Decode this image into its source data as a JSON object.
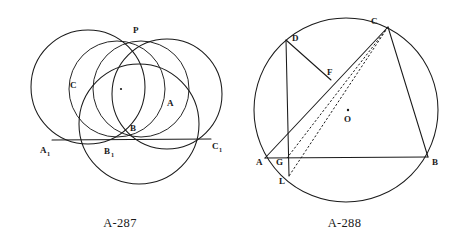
{
  "page": {
    "background": "#ffffff",
    "ink_color": "#1a1a1a",
    "width": 459,
    "height": 248
  },
  "figures": [
    {
      "id": "A-287",
      "caption": "A-287",
      "description": "Four mutually intersecting circles concurrent at point P, cut by the transversal line A1C1",
      "labels": {
        "p": "P",
        "a": "A",
        "b": "B",
        "c": "C",
        "a1_base": "A",
        "a1_sub": "1",
        "b1_base": "B",
        "b1_sub": "1",
        "c1_base": "C",
        "c1_sub": "1"
      },
      "points": {
        "P": {
          "x": 138,
          "y": 41
        },
        "A1": {
          "x": 52,
          "y": 140
        },
        "B1": {
          "x": 110,
          "y": 141
        },
        "C1": {
          "x": 211,
          "y": 139
        },
        "B": {
          "x": 124,
          "y": 133
        },
        "center_dot": {
          "x": 121,
          "y": 89
        }
      },
      "circles": [
        {
          "name": "big-left-circle",
          "cx": 88,
          "cy": 87,
          "r": 57
        },
        {
          "name": "big-right-circle",
          "cx": 167,
          "cy": 94,
          "r": 55
        },
        {
          "name": "bottom-circle",
          "cx": 139,
          "cy": 124,
          "r": 60
        },
        {
          "name": "small-mid-circle",
          "cx": 117,
          "cy": 89,
          "r": 48
        },
        {
          "name": "small-inner-circle",
          "cx": 141,
          "cy": 89,
          "r": 48
        }
      ],
      "segments": [
        {
          "name": "transversal-A1C1",
          "x1": 52,
          "y1": 140,
          "x2": 211,
          "y2": 139
        }
      ]
    },
    {
      "id": "A-288",
      "caption": "A-288",
      "description": "Circle with center O, inscribed triangle ABC, point D on arc, chord AC through F, vertical line D-G-L, dashed lines CL and CG",
      "labels": {
        "a": "A",
        "b": "B",
        "c": "C",
        "d": "D",
        "f": "F",
        "g": "G",
        "l": "L",
        "o": "O"
      },
      "circle": {
        "name": "circumcircle",
        "cx": 346,
        "cy": 110,
        "r": 92
      },
      "points": {
        "A": {
          "x": 265,
          "y": 158
        },
        "B": {
          "x": 428,
          "y": 157
        },
        "C": {
          "x": 388,
          "y": 27
        },
        "D": {
          "x": 286,
          "y": 40
        },
        "F": {
          "x": 331,
          "y": 80
        },
        "G": {
          "x": 287,
          "y": 158
        },
        "L": {
          "x": 289,
          "y": 176
        },
        "O": {
          "x": 348,
          "y": 110
        }
      },
      "solid_segments": [
        {
          "name": "side-AB",
          "from": "A",
          "to": "B"
        },
        {
          "name": "side-BC",
          "from": "B",
          "to": "C"
        },
        {
          "name": "chord-AC",
          "from": "A",
          "to": "C"
        },
        {
          "name": "segment-DF",
          "from": "D",
          "to": "F"
        },
        {
          "name": "vertical-DL",
          "from": "D",
          "to": "L"
        }
      ],
      "dashed_segments": [
        {
          "name": "dashed-CL",
          "from": "C",
          "to": "L"
        },
        {
          "name": "dashed-CG",
          "from": "C",
          "to": "G"
        }
      ]
    }
  ]
}
